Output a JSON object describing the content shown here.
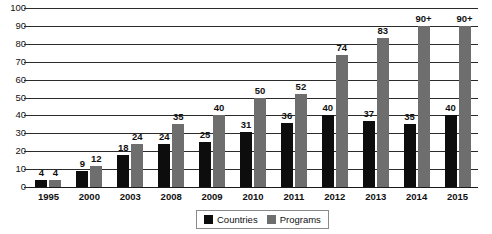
{
  "chart_data": {
    "type": "bar",
    "title": "",
    "xlabel": "",
    "ylabel": "",
    "ylim": [
      0,
      100
    ],
    "ytick_step": 10,
    "yticks": [
      100,
      90,
      80,
      70,
      60,
      50,
      40,
      30,
      20,
      10,
      0
    ],
    "grid": true,
    "legend_position": "bottom-center",
    "categories": [
      "1995",
      "2000",
      "2003",
      "2008",
      "2009",
      "2010",
      "2011",
      "2012",
      "2013",
      "2014",
      "2015"
    ],
    "series": [
      {
        "name": "Countries",
        "color": "#0d0d0d",
        "values": [
          4,
          9,
          18,
          24,
          25,
          31,
          36,
          40,
          37,
          35,
          40
        ],
        "labels": [
          "4",
          "9",
          "18",
          "24",
          "25",
          "31",
          "36",
          "40",
          "37",
          "35",
          "40"
        ]
      },
      {
        "name": "Programs",
        "color": "#6e6e6e",
        "values": [
          4,
          12,
          24,
          35,
          40,
          50,
          52,
          74,
          83,
          90,
          90
        ],
        "labels": [
          "4",
          "12",
          "24",
          "35",
          "40",
          "50",
          "52",
          "74",
          "83",
          "90+",
          "90+"
        ]
      }
    ]
  },
  "legend": {
    "items": [
      {
        "label": "Countries",
        "color": "#0d0d0d"
      },
      {
        "label": "Programs",
        "color": "#6e6e6e"
      }
    ]
  }
}
